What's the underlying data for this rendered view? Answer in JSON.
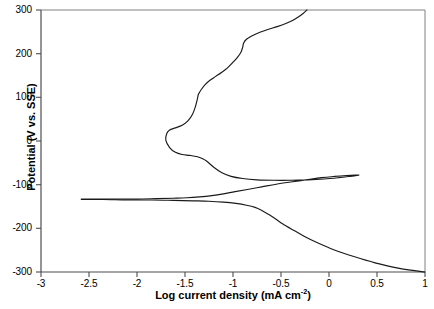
{
  "chart_data": {
    "type": "line",
    "title": "",
    "xlabel": "Log current density (mA cm",
    "xlabel_sup": "-2",
    "xlabel_tail": ")",
    "ylabel": "Potential (V vs. SSE)",
    "xlim": [
      -3,
      1
    ],
    "ylim": [
      -300,
      300
    ],
    "grid": false,
    "legend": "none",
    "line_color": "#1a1a1a",
    "xticks": [
      "-3",
      "-2.5",
      "-2",
      "-1.5",
      "-1",
      "-0.5",
      "0",
      "0.5",
      "1"
    ],
    "xtick_values": [
      -3,
      -2.5,
      -2,
      -1.5,
      -1,
      -0.5,
      0,
      0.5,
      1
    ],
    "yticks": [
      "300",
      "200",
      "100",
      "0",
      "-100",
      "-200",
      "-300"
    ],
    "ytick_values": [
      300,
      200,
      100,
      0,
      -100,
      -200,
      -300
    ],
    "series": [
      {
        "name": "Anodic polarization branch",
        "points": [
          [
            -2.58,
            -133
          ],
          [
            -2.4,
            -133
          ],
          [
            -2.2,
            -133
          ],
          [
            -2.0,
            -133
          ],
          [
            -1.8,
            -132
          ],
          [
            -1.62,
            -131
          ],
          [
            -1.48,
            -130
          ],
          [
            -1.35,
            -128
          ],
          [
            -1.22,
            -125
          ],
          [
            -1.1,
            -121
          ],
          [
            -0.98,
            -116
          ],
          [
            -0.85,
            -111
          ],
          [
            -0.7,
            -105
          ],
          [
            -0.55,
            -99
          ],
          [
            -0.4,
            -94
          ],
          [
            -0.24,
            -89
          ],
          [
            -0.08,
            -84
          ],
          [
            0.06,
            -81
          ],
          [
            0.18,
            -79
          ],
          [
            0.27,
            -78
          ],
          [
            0.31,
            -78
          ],
          [
            0.29,
            -79
          ],
          [
            0.22,
            -81
          ],
          [
            0.1,
            -84
          ],
          [
            -0.05,
            -87
          ],
          [
            -0.22,
            -89
          ],
          [
            -0.4,
            -90
          ],
          [
            -0.58,
            -90
          ],
          [
            -0.75,
            -89
          ],
          [
            -0.9,
            -86
          ],
          [
            -1.02,
            -81
          ],
          [
            -1.12,
            -72
          ],
          [
            -1.2,
            -60
          ],
          [
            -1.27,
            -47
          ],
          [
            -1.31,
            -41
          ],
          [
            -1.37,
            -36
          ],
          [
            -1.45,
            -33
          ],
          [
            -1.53,
            -31
          ],
          [
            -1.6,
            -26
          ],
          [
            -1.66,
            -15
          ],
          [
            -1.7,
            2
          ],
          [
            -1.69,
            17
          ],
          [
            -1.66,
            25
          ],
          [
            -1.6,
            30
          ],
          [
            -1.53,
            36
          ],
          [
            -1.47,
            46
          ],
          [
            -1.42,
            62
          ],
          [
            -1.39,
            80
          ],
          [
            -1.37,
            97
          ],
          [
            -1.36,
            107
          ],
          [
            -1.33,
            118
          ],
          [
            -1.29,
            129
          ],
          [
            -1.24,
            139
          ],
          [
            -1.18,
            148
          ],
          [
            -1.12,
            157
          ],
          [
            -1.06,
            167
          ],
          [
            -1.01,
            178
          ],
          [
            -0.96,
            190
          ],
          [
            -0.92,
            202
          ],
          [
            -0.9,
            214
          ],
          [
            -0.89,
            224
          ],
          [
            -0.86,
            233
          ],
          [
            -0.8,
            241
          ],
          [
            -0.72,
            249
          ],
          [
            -0.63,
            256
          ],
          [
            -0.54,
            262
          ],
          [
            -0.45,
            269
          ],
          [
            -0.38,
            276
          ],
          [
            -0.32,
            284
          ],
          [
            -0.27,
            292
          ],
          [
            -0.23,
            300
          ]
        ]
      },
      {
        "name": "Cathodic polarization branch",
        "points": [
          [
            -2.58,
            -134
          ],
          [
            -2.35,
            -134
          ],
          [
            -2.1,
            -135
          ],
          [
            -1.85,
            -135
          ],
          [
            -1.62,
            -136
          ],
          [
            -1.42,
            -137
          ],
          [
            -1.25,
            -138
          ],
          [
            -1.1,
            -140
          ],
          [
            -0.97,
            -143
          ],
          [
            -0.86,
            -147
          ],
          [
            -0.77,
            -152
          ],
          [
            -0.7,
            -159
          ],
          [
            -0.63,
            -168
          ],
          [
            -0.56,
            -178
          ],
          [
            -0.48,
            -190
          ],
          [
            -0.38,
            -203
          ],
          [
            -0.26,
            -218
          ],
          [
            -0.12,
            -233
          ],
          [
            0.05,
            -249
          ],
          [
            0.25,
            -264
          ],
          [
            0.48,
            -279
          ],
          [
            0.72,
            -291
          ],
          [
            1.0,
            -300
          ]
        ]
      }
    ],
    "annotations": {
      "critical_current_density_log": 0.31,
      "critical_peak_potential": -78,
      "passivation_min_log": -1.7,
      "corrosion_potential": -133
    }
  },
  "axes": {
    "plot_left_px": 41,
    "plot_right_px": 425,
    "plot_top_px": 10,
    "plot_bottom_px": 272
  }
}
